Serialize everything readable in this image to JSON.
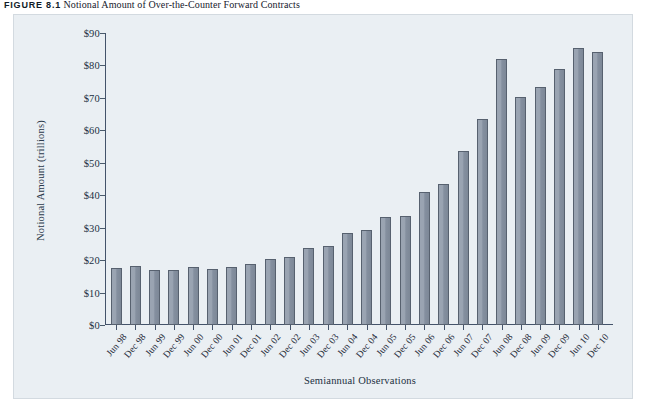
{
  "figure": {
    "label": "FIGURE 8.1",
    "title": "Notional Amount of Over-the-Counter Forward Contracts"
  },
  "colors": {
    "panel_background": "#eaeff3",
    "bar_fill": "#8e99a8",
    "bar_border": "#57616f",
    "axis": "#44536a",
    "text": "#22303f"
  },
  "chart_data": {
    "type": "bar",
    "title": "Notional Amount of Over-the-Counter Forward Contracts",
    "xlabel": "Semiannual Observations",
    "ylabel": "Notional Amount (trillions)",
    "ylim": [
      0,
      90
    ],
    "ytick_labels": [
      "$0",
      "$10",
      "$20",
      "$30",
      "$40",
      "$50",
      "$60",
      "$70",
      "$80",
      "$90"
    ],
    "ytick_values": [
      0,
      10,
      20,
      30,
      40,
      50,
      60,
      70,
      80,
      90
    ],
    "grid": false,
    "legend": "none",
    "categories": [
      "Jun 98",
      "Dec 98",
      "Jun 99",
      "Dec 99",
      "Jun 00",
      "Dec 00",
      "Jun 01",
      "Dec 01",
      "Jun 02",
      "Dec 02",
      "Jun 03",
      "Dec 03",
      "Jun 04",
      "Dec 04",
      "Jun 05",
      "Dec 05",
      "Jun 06",
      "Dec 06",
      "Jun 07",
      "Dec 07",
      "Jun 08",
      "Dec 08",
      "Jun 09",
      "Dec 09",
      "Jun 10",
      "Dec 10"
    ],
    "values": [
      17.6,
      18.2,
      17.0,
      16.9,
      17.8,
      17.2,
      17.8,
      18.9,
      20.4,
      21.0,
      23.6,
      24.5,
      28.4,
      29.4,
      33.2,
      33.5,
      41.0,
      43.4,
      53.5,
      63.4,
      82.0,
      70.4,
      73.5,
      79.0,
      85.5,
      84.0
    ]
  }
}
